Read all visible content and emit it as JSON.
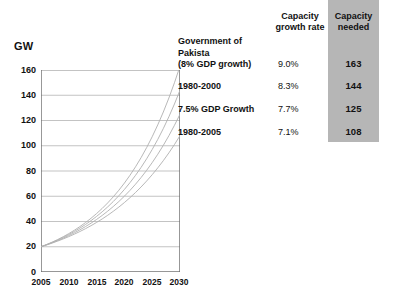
{
  "chart_data": {
    "type": "line",
    "title": "",
    "xlabel": "",
    "ylabel": "GW",
    "xlim": [
      2005,
      2030
    ],
    "ylim": [
      0,
      160
    ],
    "xticks": [
      2005,
      2010,
      2015,
      2020,
      2025,
      2030
    ],
    "yticks": [
      0,
      20,
      40,
      60,
      80,
      100,
      120,
      140,
      160
    ],
    "grid": true,
    "legend_position": "right-table",
    "x": [
      2005,
      2010,
      2015,
      2020,
      2025,
      2030
    ],
    "series": [
      {
        "name": "Government of Pakista (8% GDP growth)",
        "growth_rate": "9.0%",
        "capacity_needed": 163,
        "values": [
          20,
          30.8,
          47.3,
          72.8,
          112.0,
          163.0
        ]
      },
      {
        "name": "1980-2000",
        "growth_rate": "8.3%",
        "capacity_needed": 144,
        "values": [
          20,
          29.8,
          44.4,
          66.2,
          98.7,
          144.0
        ]
      },
      {
        "name": "7.5% GDP Growth",
        "growth_rate": "7.7%",
        "capacity_needed": 125,
        "values": [
          20,
          28.9,
          41.9,
          60.7,
          88.0,
          125.0
        ]
      },
      {
        "name": "1980-2005",
        "growth_rate": "7.1%",
        "capacity_needed": 108,
        "values": [
          20,
          28.2,
          39.7,
          56.0,
          78.9,
          108.0
        ]
      }
    ]
  },
  "chart": {
    "y_axis_title": "GW",
    "y_tick_labels": [
      "160",
      "140",
      "120",
      "100",
      "80",
      "60",
      "40",
      "20",
      "0"
    ],
    "x_tick_labels": [
      "2005",
      "2010",
      "2015",
      "2020",
      "2025",
      "2030"
    ]
  },
  "table": {
    "header_growth_rate": "Capacity\ngrowth rate",
    "header_growth_rate_line1": "Capacity",
    "header_growth_rate_line2": "growth rate",
    "header_capacity_needed_line1": "Capacity",
    "header_capacity_needed_line2": "needed",
    "highlight_color": "#b6b6b6",
    "rows": [
      {
        "label_line1": "Government of",
        "label_line2": "Pakista",
        "label_line3": "(8% GDP growth)",
        "rate": "9.0%",
        "needed": "163"
      },
      {
        "label_line1": "1980-2000",
        "label_line2": "",
        "label_line3": "",
        "rate": "8.3%",
        "needed": "144"
      },
      {
        "label_line1": "7.5% GDP Growth",
        "label_line2": "",
        "label_line3": "",
        "rate": "7.7%",
        "needed": "125"
      },
      {
        "label_line1": "1980-2005",
        "label_line2": "",
        "label_line3": "",
        "rate": "7.1%",
        "needed": "108"
      }
    ]
  }
}
